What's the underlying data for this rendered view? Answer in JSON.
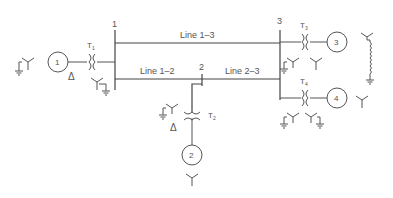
{
  "diagram": {
    "type": "one-line power system diagram",
    "colors": {
      "line": "#444444",
      "text": "#555555",
      "background": "#ffffff"
    },
    "buses": [
      {
        "id": "1",
        "label": "1"
      },
      {
        "id": "2",
        "label": "2"
      },
      {
        "id": "3",
        "label": "3"
      }
    ],
    "lines": [
      {
        "id": "line-1-3",
        "label": "Line 1–3"
      },
      {
        "id": "line-1-2",
        "label": "Line 1–2"
      },
      {
        "id": "line-2-3",
        "label": "Line 2–3"
      }
    ],
    "transformers": [
      {
        "id": "T1",
        "label": "T",
        "sub": "1"
      },
      {
        "id": "T2",
        "label": "T",
        "sub": "2"
      },
      {
        "id": "T3",
        "label": "T",
        "sub": "3"
      },
      {
        "id": "T4",
        "label": "T",
        "sub": "4"
      }
    ],
    "generators": [
      {
        "id": "G1",
        "label": "1"
      },
      {
        "id": "G2",
        "label": "2"
      },
      {
        "id": "G3",
        "label": "3"
      },
      {
        "id": "G4",
        "label": "4"
      }
    ],
    "symbols": {
      "delta": "Δ"
    }
  }
}
